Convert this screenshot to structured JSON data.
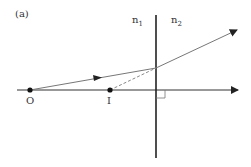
{
  "figure": {
    "panel_label": "(a)",
    "medium_left": {
      "symbol": "n",
      "subscript": "1"
    },
    "medium_right": {
      "symbol": "n",
      "subscript": "2"
    },
    "points": {
      "object": "O",
      "image": "I"
    },
    "colors": {
      "axis": "#222222",
      "ray": "#777777",
      "dashed": "#888888",
      "point": "#111111",
      "text": "#333333"
    }
  }
}
